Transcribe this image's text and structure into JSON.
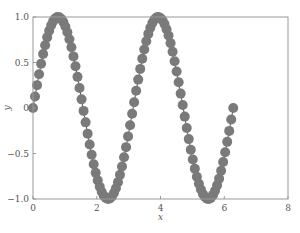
{
  "chart_data": {
    "type": "scatter",
    "title": "",
    "xlabel": "x",
    "ylabel": "y",
    "xlim": [
      0,
      8
    ],
    "ylim": [
      -1.0,
      1.0
    ],
    "grid": false,
    "legend": null,
    "x_ticks": [
      0,
      2,
      4,
      6,
      8
    ],
    "x_tick_labels": [
      "0",
      "2",
      "4",
      "6",
      "8"
    ],
    "y_ticks": [
      -1.0,
      -0.5,
      0,
      0.5,
      1.0
    ],
    "y_tick_labels": [
      "−1.0",
      "−0.5",
      "0",
      "0.5",
      "1.0"
    ],
    "series": [
      {
        "name": "sin(2x)",
        "function": "y = sin(2x)",
        "x_range": [
          0,
          6.283
        ],
        "num_points": 100,
        "marker": "circle",
        "line": true,
        "color": "#7a7a7a"
      }
    ],
    "sample_points": [
      {
        "x": 0.0,
        "y": 0.0
      },
      {
        "x": 0.785,
        "y": 1.0
      },
      {
        "x": 1.571,
        "y": 0.0
      },
      {
        "x": 2.356,
        "y": -1.0
      },
      {
        "x": 3.142,
        "y": 0.0
      },
      {
        "x": 3.927,
        "y": 1.0
      },
      {
        "x": 4.712,
        "y": 0.0
      },
      {
        "x": 5.498,
        "y": -1.0
      },
      {
        "x": 6.283,
        "y": 0.0
      }
    ]
  },
  "plot_area": {
    "left": 33,
    "top": 17,
    "right": 288,
    "bottom": 199
  }
}
